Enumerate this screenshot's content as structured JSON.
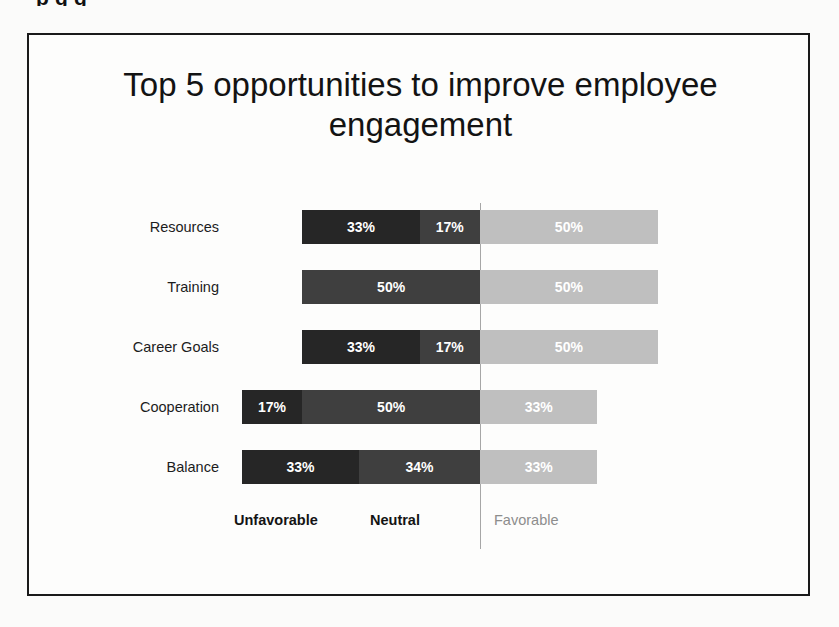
{
  "cropped_top_text": "p       g g",
  "chart_data": {
    "type": "bar",
    "subtype": "diverging-stacked-bar",
    "orientation": "horizontal",
    "title": "Top 5 opportunities to improve employee engagement",
    "xlabel": "",
    "ylabel": "",
    "grid": false,
    "legend_position": "bottom",
    "categories": [
      "Resources",
      "Training",
      "Career Goals",
      "Cooperation",
      "Balance"
    ],
    "series": [
      {
        "name": "Unfavorable",
        "color": "#262626",
        "values": [
          33,
          0,
          33,
          17,
          33
        ]
      },
      {
        "name": "Neutral",
        "color": "#3f3f3f",
        "values": [
          17,
          50,
          17,
          50,
          34
        ]
      },
      {
        "name": "Favorable",
        "color": "#bfbfbf",
        "values": [
          50,
          50,
          50,
          33,
          33
        ]
      }
    ],
    "value_suffix": "%",
    "rows": [
      {
        "label": "Resources",
        "unfavorable": {
          "value": 33,
          "text": "33%"
        },
        "neutral": {
          "value": 17,
          "text": "17%"
        },
        "favorable": {
          "value": 50,
          "text": "50%"
        }
      },
      {
        "label": "Training",
        "unfavorable": {
          "value": 0,
          "text": ""
        },
        "neutral": {
          "value": 50,
          "text": "50%"
        },
        "favorable": {
          "value": 50,
          "text": "50%"
        }
      },
      {
        "label": "Career Goals",
        "unfavorable": {
          "value": 33,
          "text": "33%"
        },
        "neutral": {
          "value": 17,
          "text": "17%"
        },
        "favorable": {
          "value": 50,
          "text": "50%"
        }
      },
      {
        "label": "Cooperation",
        "unfavorable": {
          "value": 17,
          "text": "17%"
        },
        "neutral": {
          "value": 50,
          "text": "50%"
        },
        "favorable": {
          "value": 33,
          "text": "33%"
        }
      },
      {
        "label": "Balance",
        "unfavorable": {
          "value": 33,
          "text": "33%"
        },
        "neutral": {
          "value": 34,
          "text": "34%"
        },
        "favorable": {
          "value": 33,
          "text": "33%"
        }
      }
    ]
  },
  "legend": {
    "unfavorable": "Unfavorable",
    "neutral": "Neutral",
    "favorable": "Favorable"
  },
  "colors": {
    "unfavorable": "#262626",
    "neutral": "#3f3f3f",
    "favorable": "#bfbfbf",
    "divider": "#a6a6a6",
    "frame": "#1a1a1a",
    "background": "#fdfdfc"
  }
}
